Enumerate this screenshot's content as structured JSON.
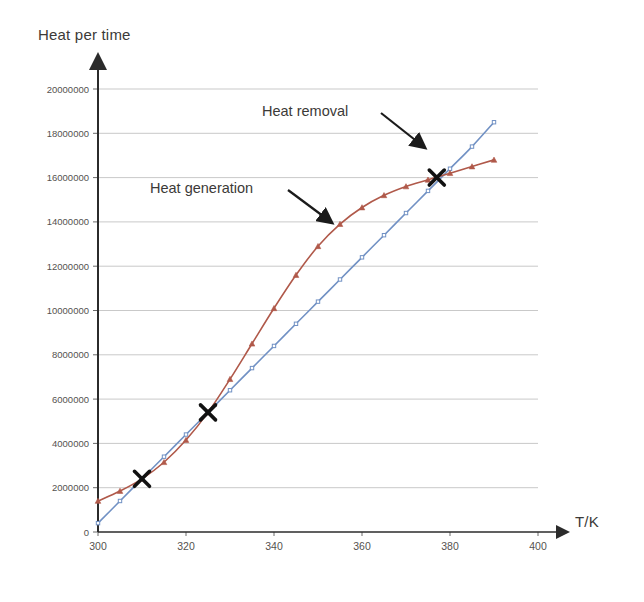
{
  "chart_data": {
    "type": "line",
    "title": "",
    "xlabel": "T/K",
    "ylabel": "Heat per time",
    "xlim": [
      300,
      400
    ],
    "ylim": [
      0,
      20000000
    ],
    "xticks": [
      300,
      320,
      340,
      360,
      380,
      400
    ],
    "yticks": [
      0,
      2000000,
      4000000,
      6000000,
      8000000,
      10000000,
      12000000,
      14000000,
      16000000,
      18000000,
      20000000
    ],
    "ytick_labels": [
      "0",
      "2000000",
      "4000000",
      "6000000",
      "8000000",
      "10000000",
      "12000000",
      "14000000",
      "16000000",
      "18000000",
      "20000000"
    ],
    "xtick_labels": [
      "300",
      "320",
      "340",
      "360",
      "380",
      "400"
    ],
    "grid": "horizontal",
    "legend": "none",
    "series": [
      {
        "name": "Heat generation",
        "color": "#b0594a",
        "marker": "triangle",
        "x": [
          300,
          305,
          310,
          315,
          320,
          325,
          330,
          335,
          340,
          345,
          350,
          355,
          360,
          365,
          370,
          375,
          380,
          385,
          390
        ],
        "values": [
          1400000,
          1850000,
          2400000,
          3150000,
          4150000,
          5400000,
          6900000,
          8500000,
          10100000,
          11600000,
          12900000,
          13900000,
          14650000,
          15200000,
          15600000,
          15900000,
          16200000,
          16500000,
          16800000
        ]
      },
      {
        "name": "Heat removal",
        "color": "#7191c4",
        "marker": "dot",
        "x": [
          300,
          305,
          310,
          315,
          320,
          325,
          330,
          335,
          340,
          345,
          350,
          355,
          360,
          365,
          370,
          375,
          380,
          385,
          390
        ],
        "values": [
          400000,
          1400000,
          2400000,
          3400000,
          4400000,
          5400000,
          6400000,
          7400000,
          8400000,
          9400000,
          10400000,
          11400000,
          12400000,
          13400000,
          14400000,
          15400000,
          16400000,
          17400000,
          18500000
        ]
      }
    ],
    "intersections": [
      {
        "label": "lower steady state",
        "x": 310,
        "y": 2400000
      },
      {
        "label": "middle unstable state",
        "x": 325,
        "y": 5400000
      },
      {
        "label": "upper steady state",
        "x": 377,
        "y": 16000000
      }
    ],
    "annotations": [
      {
        "name": "heat-removal",
        "text": "Heat removal",
        "target_x": 382,
        "target_y": 17600000
      },
      {
        "name": "heat-generation",
        "text": "Heat generation",
        "target_x": 360,
        "target_y": 14650000
      }
    ]
  }
}
